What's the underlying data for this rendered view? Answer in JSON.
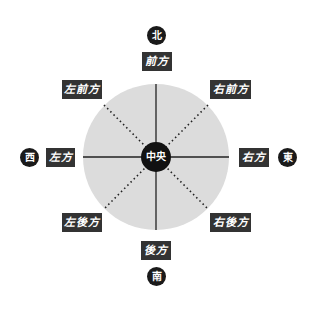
{
  "diagram": {
    "center_label": "中央",
    "directions": {
      "north": "北",
      "south": "南",
      "east": "東",
      "west": "西"
    },
    "positions": {
      "front": "前方",
      "back": "後方",
      "left": "左方",
      "right": "右方",
      "front_left": "左前方",
      "front_right": "右前方",
      "back_left": "左後方",
      "back_right": "右後方"
    },
    "colors": {
      "circle": "#dcdcdc",
      "label_bg": "#333333",
      "marker_bg": "#1a1a1a"
    }
  }
}
